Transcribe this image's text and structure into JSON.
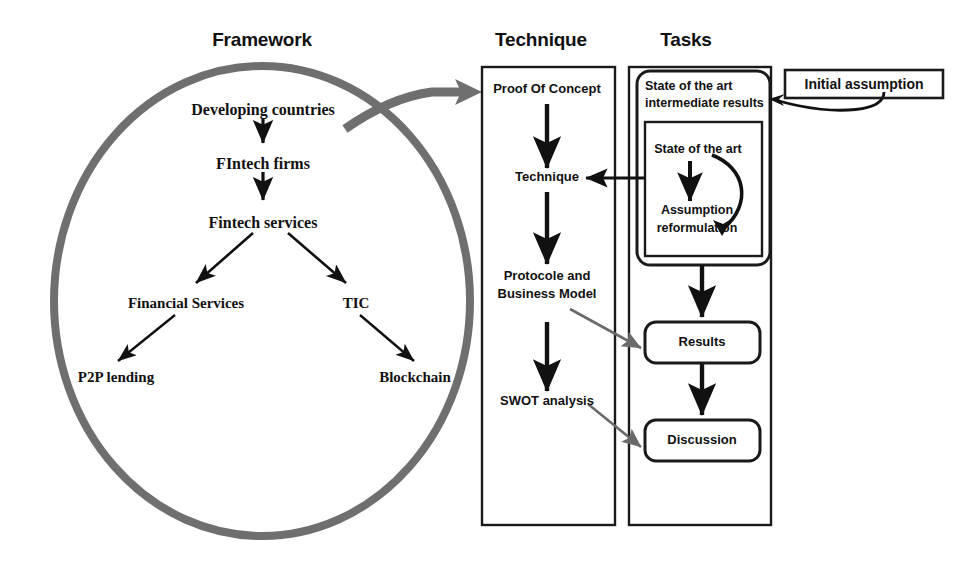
{
  "columns": {
    "framework": {
      "title": "Framework"
    },
    "technique": {
      "title": "Technique"
    },
    "tasks": {
      "title": "Tasks"
    }
  },
  "framework_tree": {
    "root": "Developing countries",
    "level2": "FIntech firms",
    "level3": "Fintech services",
    "branch_left": "Financial Services",
    "branch_right": "TIC",
    "leaf_left": "P2P lending",
    "leaf_right": "Blockchain"
  },
  "technique_steps": [
    "Proof Of Concept",
    "Technique",
    "Protocole and",
    "Business Model",
    "SWOT analysis"
  ],
  "tasks": {
    "state_of_art_intermediate_l1": "State of the art",
    "state_of_art_intermediate_l2": "intermediate results",
    "state_of_the_art": "State of the art",
    "assumption_l1": "Assumption",
    "assumption_l2": "reformulation",
    "results": "Results",
    "discussion": "Discussion"
  },
  "initial_assumption": {
    "label": "Initial assumption"
  },
  "colors": {
    "circle_stroke": "#6f6f6f",
    "thick_arrow": "#6f6f6f",
    "cross_arrow": "#6a6a6a",
    "box_stroke": "#1a1a1a",
    "arrow_black": "#111111",
    "background": "#ffffff"
  }
}
